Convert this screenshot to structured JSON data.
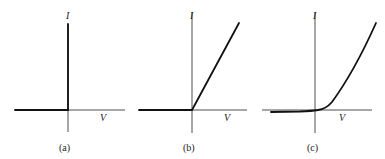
{
  "figure": {
    "panels": [
      {
        "id": "a",
        "caption": "(a)",
        "y_label": "I",
        "x_label": "V",
        "description": "Ideal diode: zero current for V<0, vertical current at V=0"
      },
      {
        "id": "b",
        "caption": "(b)",
        "y_label": "I",
        "x_label": "V",
        "description": "Piecewise linear: zero current for V<0, linear rise for V>0"
      },
      {
        "id": "c",
        "caption": "(c)",
        "y_label": "I",
        "x_label": "V",
        "description": "Real diode: small reverse current, exponential-like rise for V>0"
      }
    ]
  },
  "colors": {
    "line": "#111111",
    "axis": "#222222",
    "background": "#ffffff"
  }
}
